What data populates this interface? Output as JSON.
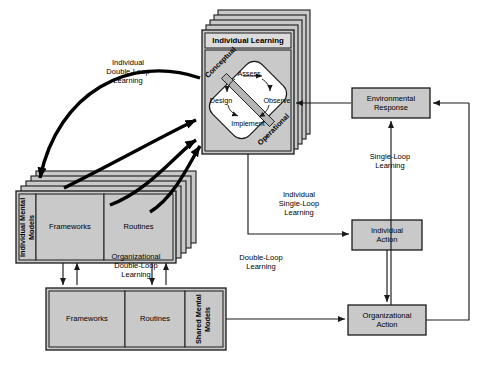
{
  "diagram": {
    "colors": {
      "box_fill": "#c9c9c9",
      "header_fill": "#dcdcdc",
      "stroke": "#1a1a1a",
      "white": "#ffffff",
      "band": "#b5b5b5",
      "background": "#ffffff"
    }
  },
  "nodes": {
    "individual_learning": {
      "header": "Individual Learning",
      "cycle": {
        "assess": "Assess",
        "observe": "Observe",
        "implement": "Implement",
        "design": "Design",
        "conceptual": "Conceptual",
        "operational": "Operational"
      }
    },
    "individual_mental_models": {
      "side_label": "Individual Mental Models",
      "cells": [
        "Frameworks",
        "Routines"
      ]
    },
    "shared_mental_models": {
      "side_label": "Shared Mental Models",
      "cells": [
        "Frameworks",
        "Routines"
      ]
    },
    "environmental_response": {
      "label": "Environmental\nResponse"
    },
    "individual_action": {
      "label": "Individual\nAction"
    },
    "organizational_action": {
      "label": "Organizational\nAction"
    }
  },
  "edge_labels": {
    "individual_double_loop": "Individual\nDouble-Loop\nLearning",
    "organizational_double_loop": "Organizational\nDouble-Loop\nLearning",
    "individual_single_loop": "Individual\nSingle-Loop\nLearning",
    "double_loop": "Double-Loop\nLearning",
    "single_loop": "Single-Loop\nLearning"
  }
}
